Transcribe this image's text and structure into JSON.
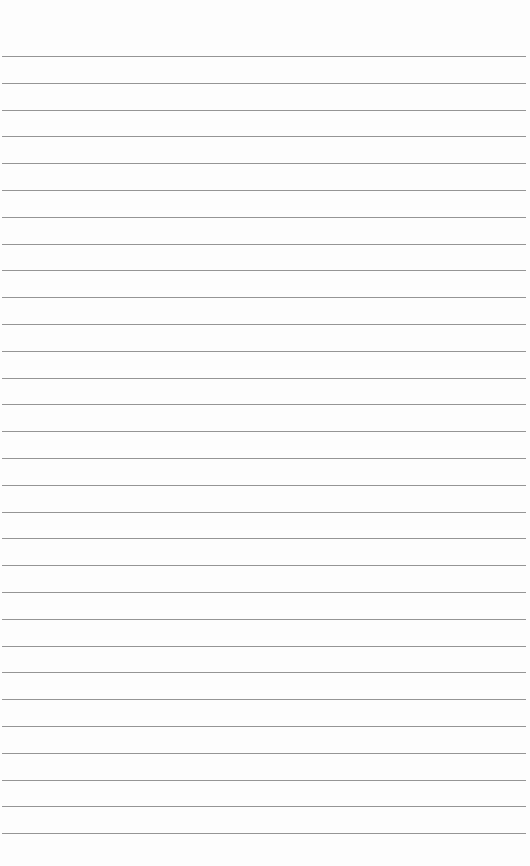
{
  "page": {
    "type": "ruled-paper",
    "background_color": "#fdfdfd",
    "line_color": "#8a8a8a",
    "line_count": 30,
    "first_line_y": 56,
    "line_spacing": 26.8,
    "line_left": 2,
    "line_right": 526
  }
}
